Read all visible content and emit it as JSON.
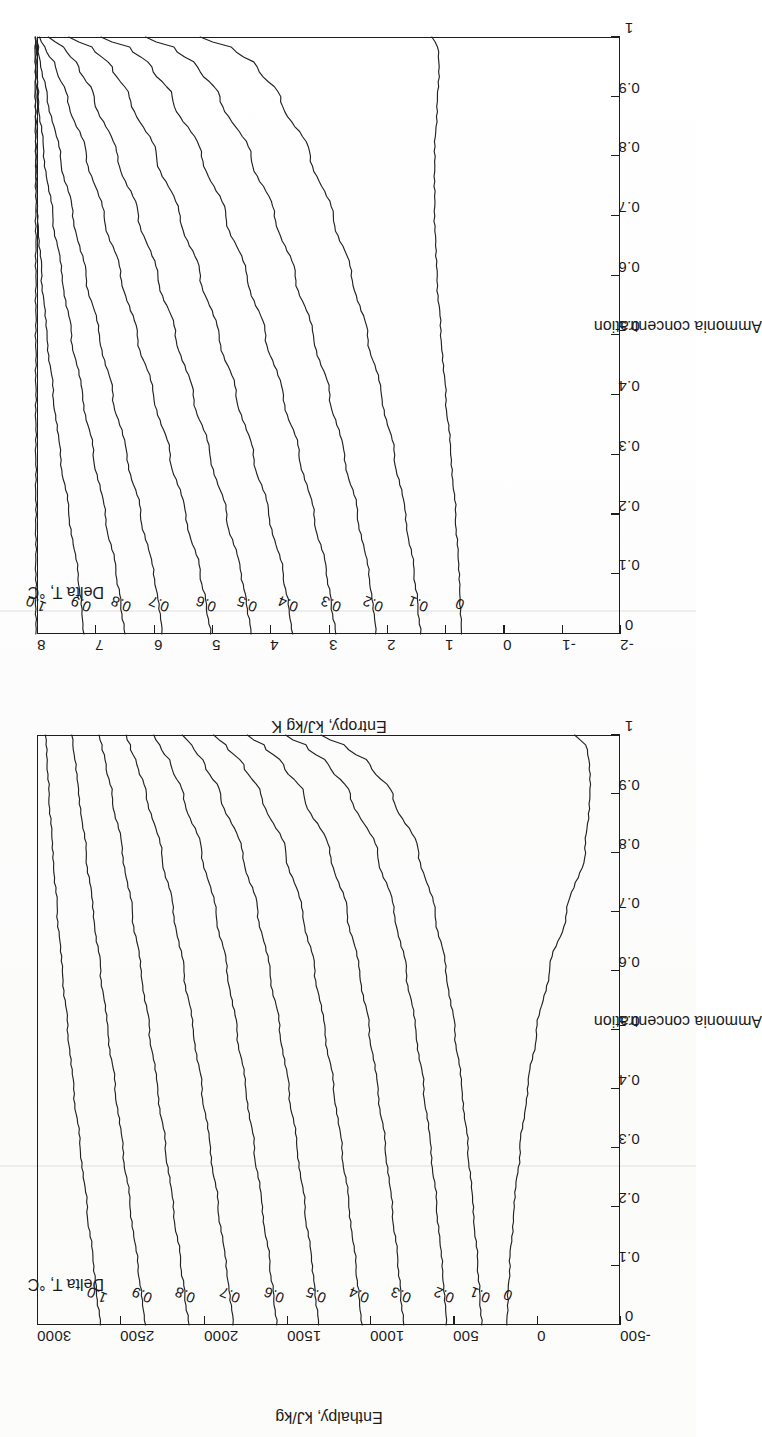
{
  "document": {
    "kind": "scanned-figure-page",
    "orientation": "landscape-rotated-90-ccw",
    "figure_count": 2
  },
  "chart_data": [
    {
      "id": "entropy-chart",
      "type": "line",
      "title": "",
      "xlabel": "Ammonia concentration",
      "ylabel": "Entropy, kJ/kg K",
      "legend_title": "Delta T, °C",
      "legend_position": "inside-upper-left",
      "grid": false,
      "xlim": [
        0,
        1
      ],
      "ylim": [
        -2,
        8
      ],
      "xticks": [
        "0",
        "0.1",
        "0.2",
        "0.3",
        "0.4",
        "0.5",
        "0.6",
        "0.7",
        "0.8",
        "0.9",
        "1"
      ],
      "xtick_values": [
        0,
        0.1,
        0.2,
        0.3,
        0.4,
        0.5,
        0.6,
        0.7,
        0.8,
        0.9,
        1
      ],
      "yticks": [
        "-2",
        "-1",
        "0",
        "1",
        "2",
        "3",
        "4",
        "5",
        "6",
        "7",
        "8"
      ],
      "ytick_values": [
        -2,
        -1,
        0,
        1,
        2,
        3,
        4,
        5,
        6,
        7,
        8
      ],
      "x": [
        0,
        0.05,
        0.1,
        0.2,
        0.3,
        0.4,
        0.5,
        0.6,
        0.7,
        0.8,
        0.9,
        0.95,
        0.98,
        1
      ],
      "series": [
        {
          "name": "1.0",
          "label": "1.0",
          "values": [
            8.02,
            8.02,
            8.02,
            8.02,
            8.02,
            8.02,
            8.02,
            8.02,
            8.02,
            8.02,
            8.02,
            8.02,
            8.02,
            8.02
          ]
        },
        {
          "name": "0.9",
          "label": "0.9",
          "values": [
            7.2,
            7.24,
            7.3,
            7.45,
            7.6,
            7.72,
            7.83,
            7.92,
            7.99,
            8.02,
            8.03,
            8.03,
            8.03,
            8.03
          ]
        },
        {
          "name": "0.8",
          "label": "0.8",
          "values": [
            6.5,
            6.56,
            6.64,
            6.83,
            7.03,
            7.22,
            7.41,
            7.57,
            7.73,
            7.88,
            7.98,
            8.0,
            8.01,
            8.02
          ]
        },
        {
          "name": "0.7",
          "label": "0.7",
          "values": [
            5.85,
            5.91,
            6.0,
            6.22,
            6.46,
            6.7,
            6.93,
            7.16,
            7.38,
            7.6,
            7.82,
            7.93,
            7.98,
            8.0
          ]
        },
        {
          "name": "0.6",
          "label": "0.6",
          "values": [
            5.02,
            5.1,
            5.2,
            5.45,
            5.72,
            6.0,
            6.28,
            6.56,
            6.85,
            7.15,
            7.48,
            7.68,
            7.85,
            7.96
          ]
        },
        {
          "name": "0.5",
          "label": "0.5",
          "values": [
            4.33,
            4.4,
            4.5,
            4.75,
            5.03,
            5.32,
            5.62,
            5.93,
            6.26,
            6.62,
            7.02,
            7.28,
            7.52,
            7.8
          ]
        },
        {
          "name": "0.4",
          "label": "0.4",
          "values": [
            3.62,
            3.69,
            3.78,
            4.02,
            4.29,
            4.58,
            4.88,
            5.2,
            5.55,
            5.95,
            6.41,
            6.72,
            7.02,
            7.45
          ]
        },
        {
          "name": "0.3",
          "label": "0.3",
          "values": [
            2.88,
            2.95,
            3.03,
            3.25,
            3.5,
            3.78,
            4.08,
            4.4,
            4.76,
            5.17,
            5.68,
            6.03,
            6.38,
            6.9
          ]
        },
        {
          "name": "0.2",
          "label": "0.2",
          "values": [
            2.18,
            2.24,
            2.31,
            2.5,
            2.73,
            2.98,
            3.26,
            3.57,
            3.92,
            4.33,
            4.86,
            5.24,
            5.62,
            6.15
          ]
        },
        {
          "name": "0.1",
          "label": "0.1",
          "values": [
            1.42,
            1.47,
            1.53,
            1.68,
            1.87,
            2.09,
            2.33,
            2.6,
            2.92,
            3.31,
            3.83,
            4.22,
            4.62,
            5.2
          ]
        },
        {
          "name": "0",
          "label": "0",
          "values": [
            0.72,
            0.74,
            0.76,
            0.82,
            0.9,
            0.99,
            1.07,
            1.14,
            1.18,
            1.18,
            1.13,
            1.1,
            1.12,
            1.22
          ]
        }
      ],
      "annotations": [
        {
          "text": "1.0",
          "x": 0.05,
          "y": 8.02
        },
        {
          "text": "0.9",
          "x": 0.05,
          "y": 7.24
        },
        {
          "text": "0.8",
          "x": 0.05,
          "y": 6.56
        },
        {
          "text": "0.7",
          "x": 0.05,
          "y": 5.91
        },
        {
          "text": "0.6",
          "x": 0.05,
          "y": 5.1
        },
        {
          "text": "0.5",
          "x": 0.05,
          "y": 4.4
        },
        {
          "text": "0.4",
          "x": 0.05,
          "y": 3.69
        },
        {
          "text": "0.3",
          "x": 0.05,
          "y": 2.95
        },
        {
          "text": "0.2",
          "x": 0.05,
          "y": 2.24
        },
        {
          "text": "0.1",
          "x": 0.05,
          "y": 1.47
        },
        {
          "text": "0",
          "x": 0.05,
          "y": 0.74
        }
      ]
    },
    {
      "id": "enthalpy-chart",
      "type": "line",
      "title": "",
      "xlabel": "Ammonia concentration",
      "ylabel": "Enthalpy, kJ/kg",
      "legend_title": "Delta T, °C",
      "legend_position": "inside-upper-left",
      "grid": false,
      "xlim": [
        0,
        1
      ],
      "ylim": [
        -500,
        3000
      ],
      "xticks": [
        "0",
        "0.1",
        "0.2",
        "0.3",
        "0.4",
        "0.5",
        "0.6",
        "0.7",
        "0.8",
        "0.9",
        "1"
      ],
      "xtick_values": [
        0,
        0.1,
        0.2,
        0.3,
        0.4,
        0.5,
        0.6,
        0.7,
        0.8,
        0.9,
        1
      ],
      "yticks": [
        "-500",
        "0",
        "500",
        "1000",
        "1500",
        "2000",
        "2500",
        "3000"
      ],
      "ytick_values": [
        -500,
        0,
        500,
        1000,
        1500,
        2000,
        2500,
        3000
      ],
      "x": [
        0,
        0.05,
        0.1,
        0.2,
        0.3,
        0.4,
        0.5,
        0.6,
        0.7,
        0.8,
        0.9,
        0.95,
        0.98,
        1
      ],
      "series": [
        {
          "name": "1.0",
          "label": "1.0",
          "values": [
            2620,
            2640,
            2660,
            2700,
            2740,
            2780,
            2815,
            2848,
            2878,
            2905,
            2928,
            2938,
            2944,
            2948
          ]
        },
        {
          "name": "0.9",
          "label": "0.9",
          "values": [
            2350,
            2372,
            2395,
            2440,
            2485,
            2530,
            2575,
            2618,
            2662,
            2705,
            2748,
            2768,
            2782,
            2790
          ]
        },
        {
          "name": "0.8",
          "label": "0.8",
          "values": [
            2090,
            2112,
            2136,
            2182,
            2228,
            2276,
            2325,
            2375,
            2428,
            2486,
            2550,
            2586,
            2610,
            2625
          ]
        },
        {
          "name": "0.7",
          "label": "0.7",
          "values": [
            1820,
            1842,
            1865,
            1912,
            1960,
            2010,
            2062,
            2118,
            2180,
            2252,
            2342,
            2398,
            2440,
            2468
          ]
        },
        {
          "name": "0.6",
          "label": "0.6",
          "values": [
            1560,
            1580,
            1602,
            1648,
            1696,
            1746,
            1800,
            1858,
            1926,
            2010,
            2122,
            2196,
            2258,
            2300
          ]
        },
        {
          "name": "0.5",
          "label": "0.5",
          "values": [
            1310,
            1328,
            1348,
            1392,
            1438,
            1488,
            1542,
            1602,
            1674,
            1766,
            1898,
            1990,
            2066,
            2125
          ]
        },
        {
          "name": "0.4",
          "label": "0.4",
          "values": [
            1050,
            1068,
            1086,
            1126,
            1170,
            1218,
            1272,
            1332,
            1406,
            1506,
            1654,
            1762,
            1858,
            1938
          ]
        },
        {
          "name": "0.3",
          "label": "0.3",
          "values": [
            800,
            815,
            832,
            868,
            908,
            954,
            1005,
            1064,
            1138,
            1240,
            1398,
            1520,
            1632,
            1736
          ]
        },
        {
          "name": "0.2",
          "label": "0.2",
          "values": [
            540,
            554,
            568,
            600,
            636,
            678,
            726,
            783,
            855,
            956,
            1118,
            1248,
            1378,
            1512
          ]
        },
        {
          "name": "0.1",
          "label": "0.1",
          "values": [
            330,
            342,
            354,
            382,
            413,
            449,
            492,
            544,
            611,
            708,
            866,
            1000,
            1142,
            1295
          ]
        },
        {
          "name": "0",
          "label": "0",
          "values": [
            180,
            172,
            162,
            136,
            100,
            55,
            0,
            -75,
            -180,
            -290,
            -320,
            -318,
            -300,
            -230
          ]
        }
      ],
      "annotations": [
        {
          "text": "1.0",
          "x": 0.05,
          "y": 2640
        },
        {
          "text": "0.9",
          "x": 0.05,
          "y": 2372
        },
        {
          "text": "0.8",
          "x": 0.05,
          "y": 2112
        },
        {
          "text": "0.7",
          "x": 0.05,
          "y": 1842
        },
        {
          "text": "0.6",
          "x": 0.05,
          "y": 1580
        },
        {
          "text": "0.5",
          "x": 0.05,
          "y": 1328
        },
        {
          "text": "0.4",
          "x": 0.05,
          "y": 1068
        },
        {
          "text": "0.3",
          "x": 0.05,
          "y": 815
        },
        {
          "text": "0.2",
          "x": 0.05,
          "y": 554
        },
        {
          "text": "0.1",
          "x": 0.05,
          "y": 342
        },
        {
          "text": "0",
          "x": 0.05,
          "y": 172
        }
      ]
    }
  ],
  "colors": {
    "line": "#222222",
    "axis": "#1d1d1d",
    "text": "#1b1b1b",
    "background": "#fdfdfc"
  }
}
